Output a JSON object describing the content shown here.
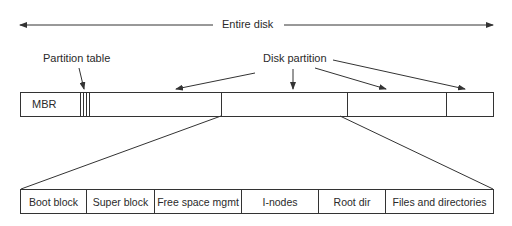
{
  "diagram": {
    "entire_disk_label": "Entire disk",
    "partition_table_label": "Partition table",
    "disk_partition_label": "Disk partition",
    "top_bar": {
      "mbr_label": "MBR",
      "partitions": 4
    },
    "bottom_bar": {
      "cells": [
        "Boot block",
        "Super block",
        "Free space mgmt",
        "I-nodes",
        "Root dir",
        "Files and directories"
      ]
    },
    "line_color": "#333333"
  }
}
